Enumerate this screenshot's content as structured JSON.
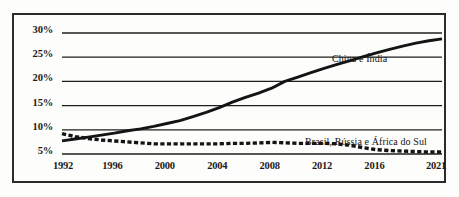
{
  "figure": {
    "background_color": "#fdfdfb",
    "border_color": "#2b2b2b",
    "line_color": "#141414",
    "grid_color": "#1f1f1f"
  },
  "chart_data": {
    "type": "line",
    "title": "",
    "subtitle": "",
    "xlabel": "",
    "ylabel": "",
    "xlim": [
      1992,
      2021
    ],
    "ylim": [
      5,
      30
    ],
    "grid": true,
    "grid_axis": "y",
    "legend": "inline-annotations",
    "ytick_labels": [
      "30%",
      "25%",
      "20%",
      "15%",
      "10%",
      "5%"
    ],
    "ytick_values": [
      30,
      25,
      20,
      15,
      10,
      5
    ],
    "xtick_labels": [
      "1992",
      "1996",
      "2000",
      "2004",
      "2008",
      "2012",
      "2016",
      "2021"
    ],
    "xtick_values": [
      1992,
      1996,
      2000,
      2004,
      2008,
      2012,
      2016,
      2021
    ],
    "x": [
      1992,
      1993,
      1994,
      1995,
      1996,
      1997,
      1998,
      1999,
      2000,
      2001,
      2002,
      2003,
      2004,
      2005,
      2006,
      2007,
      2008,
      2009,
      2010,
      2011,
      2012,
      2013,
      2014,
      2015,
      2016,
      2017,
      2018,
      2019,
      2020,
      2021
    ],
    "series": [
      {
        "name": "China e Índia",
        "style": "solid",
        "label_text": "China e Índia",
        "values": [
          7.7,
          8.1,
          8.5,
          8.9,
          9.3,
          9.8,
          10.2,
          10.7,
          11.3,
          11.9,
          12.7,
          13.6,
          14.6,
          15.7,
          16.7,
          17.6,
          18.6,
          20.0,
          20.9,
          21.8,
          22.7,
          23.5,
          24.3,
          25.1,
          25.9,
          26.6,
          27.3,
          27.9,
          28.4,
          28.8
        ]
      },
      {
        "name": "Brasil, Rússia e África do Sul",
        "style": "dashed",
        "label_text": "Brasil, Rússia e África do Sul",
        "values": [
          9.2,
          8.6,
          8.2,
          7.9,
          7.7,
          7.5,
          7.3,
          7.1,
          7.1,
          7.1,
          7.1,
          7.1,
          7.1,
          7.2,
          7.2,
          7.3,
          7.4,
          7.3,
          7.2,
          7.2,
          7.2,
          7.1,
          6.8,
          6.3,
          5.9,
          5.7,
          5.6,
          5.5,
          5.4,
          5.4
        ]
      }
    ]
  }
}
